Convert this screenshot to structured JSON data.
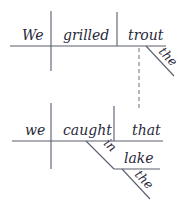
{
  "diagram": {
    "type": "sentence-diagram",
    "main_clause": {
      "subject": "We",
      "verb": "grilled",
      "object": "trout",
      "object_modifier": "the"
    },
    "relative_clause": {
      "subject": "we",
      "verb": "caught",
      "object": "that",
      "preposition": "in",
      "prep_object": "lake",
      "prep_object_modifier": "the"
    },
    "colors": {
      "line": "#5a5e6e",
      "text": "#2a2a3a",
      "background": "#ffffff"
    }
  }
}
